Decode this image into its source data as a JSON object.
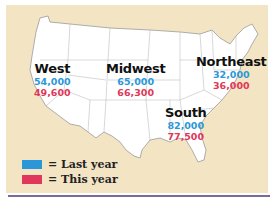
{
  "regions": {
    "west": {
      "name": "West",
      "last_year": "54,000",
      "this_year": "49,600"
    },
    "midwest": {
      "name": "Midwest",
      "last_year": "65,000",
      "this_year": "66,300"
    },
    "northeast": {
      "name": "Northeast",
      "last_year": "32,000",
      "this_year": "36,000"
    },
    "south": {
      "name": "South",
      "last_year": "82,000",
      "this_year": "77,500"
    }
  },
  "legend": {
    "last_year": {
      "label": "= Last year",
      "color": "#2a98d8"
    },
    "this_year": {
      "label": "= This year",
      "color": "#e0385a"
    }
  },
  "colors": {
    "background": "#f3e4c4",
    "land": "#ffffff",
    "border": "#9a9a9a",
    "rule": "#7a6b9a"
  }
}
